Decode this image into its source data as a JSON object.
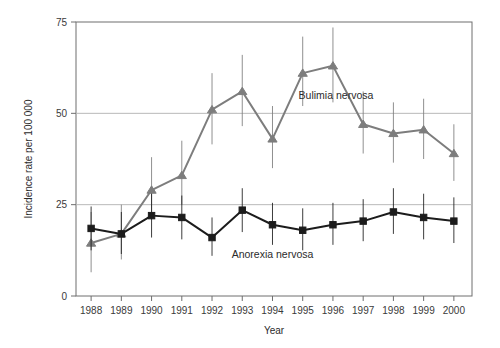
{
  "chart_data": {
    "type": "line",
    "title": "",
    "xlabel": "Year",
    "ylabel": "Incidence rate per 100 000",
    "categories": [
      1988,
      1989,
      1990,
      1991,
      1992,
      1993,
      1994,
      1995,
      1996,
      1997,
      1998,
      1999,
      2000
    ],
    "xtick_labels": [
      "1988",
      "1989",
      "1990",
      "1991",
      "1992",
      "1993",
      "1994",
      "1995",
      "1996",
      "1997",
      "1998",
      "1999",
      "2000"
    ],
    "ytick_labels": [
      "0",
      "25",
      "50",
      "75"
    ],
    "yticks": [
      0,
      25,
      50,
      75
    ],
    "ylim": [
      0,
      75
    ],
    "xlim": [
      1987.5,
      2000.6
    ],
    "grid": "horizontal-at-y-25-50-75",
    "legend_position": "inline-annotation",
    "series": [
      {
        "name": "Bulimia nervosa",
        "marker": "triangle",
        "color": "#7d7d7d",
        "label_x": 1996.1,
        "label_y": 54,
        "values": [
          14.5,
          17.0,
          29.0,
          33.0,
          51.0,
          56.0,
          43.0,
          61.0,
          63.0,
          47.0,
          44.5,
          45.5,
          39.0
        ],
        "err_low": [
          6.5,
          10.0,
          21.0,
          25.0,
          41.5,
          46.5,
          35.0,
          52.0,
          53.0,
          39.0,
          36.5,
          37.5,
          31.5
        ],
        "err_high": [
          23.0,
          25.0,
          38.0,
          42.5,
          61.0,
          66.0,
          52.0,
          71.0,
          73.5,
          56.0,
          53.0,
          54.0,
          47.0
        ]
      },
      {
        "name": "Anorexia nervosa",
        "marker": "square",
        "color": "#1c1c1c",
        "label_x": 1994.0,
        "label_y": 10.5,
        "values": [
          18.5,
          17.0,
          22.0,
          21.5,
          16.0,
          23.5,
          19.5,
          18.0,
          19.5,
          20.5,
          23.0,
          21.5,
          20.5
        ],
        "err_low": [
          12.5,
          11.5,
          16.0,
          15.5,
          11.0,
          17.5,
          14.0,
          12.5,
          14.0,
          15.0,
          17.0,
          15.5,
          14.5
        ],
        "err_high": [
          24.5,
          23.0,
          28.0,
          27.5,
          21.5,
          29.5,
          25.5,
          24.0,
          25.5,
          26.5,
          29.5,
          28.0,
          27.0
        ]
      }
    ]
  }
}
